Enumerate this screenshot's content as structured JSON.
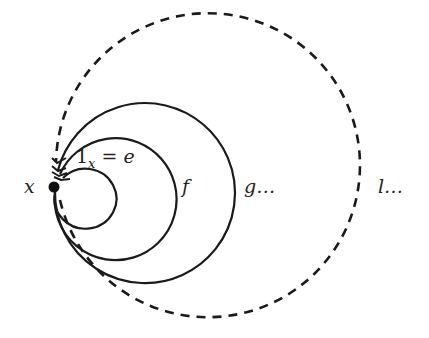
{
  "diagram": {
    "point_label": "x",
    "labels": {
      "identity": "1",
      "identity_sub": "x",
      "identity_eq": " = e",
      "f": "f",
      "g": "g…",
      "l": "l…"
    },
    "loops": [
      {
        "name": "e",
        "style": "solid"
      },
      {
        "name": "f",
        "style": "solid"
      },
      {
        "name": "g",
        "style": "solid"
      },
      {
        "name": "l",
        "style": "dashed"
      }
    ],
    "stroke_color": "#1a1a1a"
  }
}
